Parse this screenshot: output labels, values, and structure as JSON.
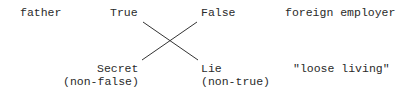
{
  "diagram": {
    "type": "semiotic-square",
    "top_row": {
      "far_left": "father",
      "left": "True",
      "right": "False",
      "far_right": "foreign employer"
    },
    "bottom_row": {
      "left": "Secret",
      "left_sub": "(non-false)",
      "right": "Lie",
      "right_sub": "(non-true)",
      "far_right": "\"loose living\""
    },
    "connections": [
      {
        "from": "True",
        "to": "Lie"
      },
      {
        "from": "False",
        "to": "Secret"
      }
    ],
    "line_color": "#333333",
    "text_color": "#2a2a2a"
  }
}
